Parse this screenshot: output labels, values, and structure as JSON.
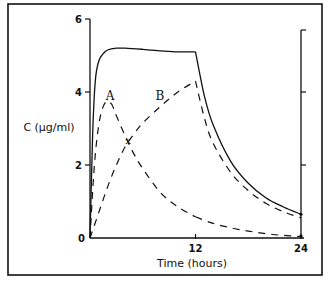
{
  "chart_data": {
    "type": "line",
    "title": "",
    "xlabel": "Time (hours)",
    "ylabel": "C (µg/ml)",
    "xlim": [
      0,
      24
    ],
    "ylim": [
      0,
      6
    ],
    "x_ticks": [
      0,
      12,
      24
    ],
    "y_ticks": [
      0,
      2,
      4,
      6
    ],
    "x_tick_labels": [
      "0",
      "12",
      "24"
    ],
    "y_tick_labels": [
      "0",
      "2",
      "4",
      "6"
    ],
    "right_axis_ticks": [
      2,
      4,
      6
    ],
    "grid": false,
    "legend": null,
    "annotations": [
      {
        "text": "A",
        "x": 2.3,
        "y": 3.9
      },
      {
        "text": "B",
        "x": 7.9,
        "y": 3.9
      },
      {
        "text": "x",
        "x": 4.3,
        "y": 2.7
      }
    ],
    "series": [
      {
        "name": "Total",
        "style": "solid",
        "x": [
          0,
          0.3,
          0.6,
          1.0,
          1.5,
          2.0,
          3.0,
          4.0,
          6.0,
          8.0,
          10.0,
          12.0,
          13.0,
          14.0,
          16.0,
          18.0,
          20.0,
          22.0,
          24.0
        ],
        "values": [
          0,
          2.8,
          4.3,
          4.85,
          5.05,
          5.15,
          5.2,
          5.2,
          5.17,
          5.13,
          5.1,
          5.1,
          3.9,
          3.1,
          2.1,
          1.5,
          1.1,
          0.85,
          0.65
        ]
      },
      {
        "name": "A",
        "style": "dashed",
        "x": [
          0,
          0.5,
          1.0,
          1.5,
          2.0,
          2.5,
          3.0,
          4.0,
          5.0,
          6.0,
          8.0,
          10.0,
          12.0,
          14.0,
          16.0,
          18.0,
          20.0,
          22.0,
          24.0
        ],
        "values": [
          0,
          2.0,
          3.1,
          3.6,
          3.75,
          3.65,
          3.35,
          2.8,
          2.3,
          1.9,
          1.25,
          0.85,
          0.58,
          0.4,
          0.28,
          0.19,
          0.12,
          0.07,
          0.04
        ]
      },
      {
        "name": "B",
        "style": "dashed",
        "x": [
          0,
          1.0,
          2.0,
          3.0,
          4.0,
          5.0,
          6.0,
          8.0,
          10.0,
          12.0,
          13.0,
          14.0,
          16.0,
          18.0,
          20.0,
          22.0,
          24.0
        ],
        "values": [
          0,
          0.7,
          1.4,
          2.0,
          2.5,
          2.85,
          3.15,
          3.6,
          4.0,
          4.3,
          3.3,
          2.6,
          1.8,
          1.3,
          0.95,
          0.72,
          0.55
        ]
      }
    ]
  },
  "axes": {
    "xlabel": "Time (hours)",
    "ylabel": "C (µg/ml)",
    "x_tick_labels": [
      "0",
      "12",
      "24"
    ],
    "y_tick_labels": [
      "2",
      "4",
      "6"
    ],
    "origin_label": "0"
  },
  "labels": {
    "curve_a": "A",
    "curve_b": "B",
    "cross_mark": "x"
  }
}
